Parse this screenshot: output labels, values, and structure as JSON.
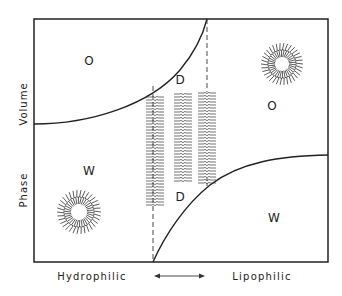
{
  "diagram": {
    "title": "",
    "y_axis": {
      "label_top": "Volume",
      "label_bottom": "Phase"
    },
    "x_axis": {
      "left": "Hydrophilic",
      "right": "Lipophilic",
      "arrow": "double-headed"
    },
    "regions": [
      {
        "id": "upper-left",
        "label": "O"
      },
      {
        "id": "upper-middle",
        "label": "D"
      },
      {
        "id": "upper-right",
        "label": "O"
      },
      {
        "id": "lower-left",
        "label": "W"
      },
      {
        "id": "lower-middle",
        "label": "D"
      },
      {
        "id": "lower-right",
        "label": "W"
      }
    ],
    "illustrations": [
      {
        "name": "reverse-micelle",
        "location": "upper-right"
      },
      {
        "name": "normal-micelle",
        "location": "lower-left"
      },
      {
        "name": "lamellar-bilayers",
        "count": 3,
        "location": "center"
      }
    ],
    "colors": {
      "line": "#222222",
      "background": "#ffffff"
    }
  }
}
